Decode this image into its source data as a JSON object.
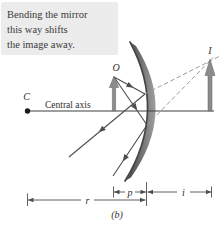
{
  "caption": {
    "line1": "Bending the mirror",
    "line2": "this way shifts",
    "line3": "the image away."
  },
  "labels": {
    "center_of_curvature": "C",
    "central_axis": "Central axis",
    "object": "O",
    "image": "I",
    "object_distance": "p",
    "image_distance": "i",
    "radius_of_curvature": "r",
    "subfigure": "(b)"
  },
  "colors": {
    "caption_bg": "#ececec",
    "text": "#3a3a3a",
    "ray": "#4d4d4d",
    "virtual_ray": "#9c9c9c",
    "arrow_fill": "#8c8c8c",
    "arrow_outline": "#5f5f5f",
    "mirror_edge": "#454545",
    "axis": "#3e3e3e"
  }
}
